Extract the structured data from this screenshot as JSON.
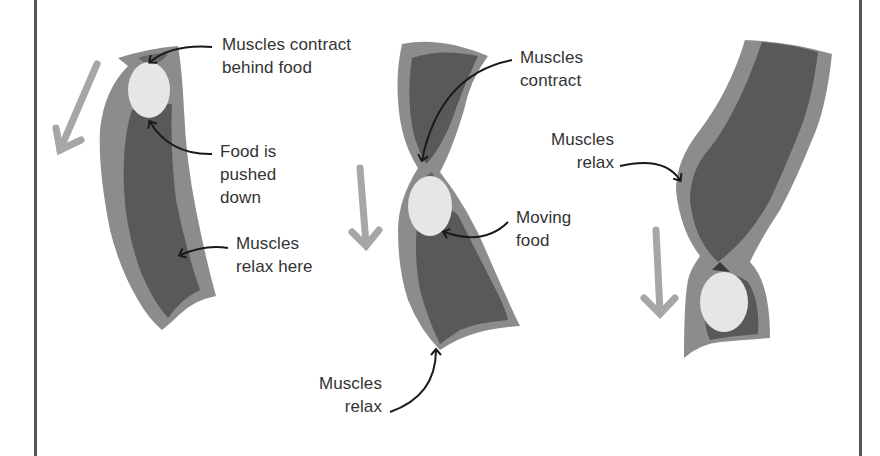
{
  "diagram": {
    "colors": {
      "wall": "#8c8c8c",
      "lumen": "#595959",
      "food": "#e6e6e6",
      "motion_arrow": "#a6a6a6",
      "pointer_arrow": "#1a1a1a",
      "border": "#555555",
      "text": "#333333"
    },
    "panels": [
      {
        "id": "stage-1",
        "labels": [
          {
            "text": "Muscles contract\nbehind food"
          },
          {
            "text": "Food is\npushed\ndown"
          },
          {
            "text": "Muscles\nrelax here"
          }
        ]
      },
      {
        "id": "stage-2",
        "labels": [
          {
            "text": "Muscles\ncontract"
          },
          {
            "text": "Moving\nfood"
          },
          {
            "text": "Muscles\nrelax"
          }
        ]
      },
      {
        "id": "stage-3",
        "labels": [
          {
            "text": "Muscles\nrelax"
          }
        ]
      }
    ]
  }
}
